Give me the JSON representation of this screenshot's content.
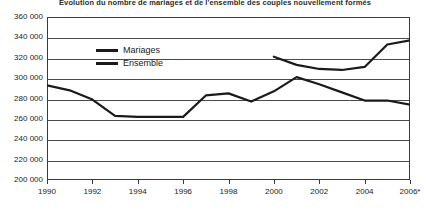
{
  "chart_data": {
    "type": "line",
    "title": "Évolution du nombre de mariages et de l'ensemble des couples nouvellement formés",
    "xlabel": "",
    "ylabel": "",
    "x": [
      1990,
      1991,
      1992,
      1993,
      1994,
      1995,
      1996,
      1997,
      1998,
      1999,
      2000,
      2001,
      2002,
      2003,
      2004,
      2005,
      2006
    ],
    "tick_labels": [
      "1990",
      "1992",
      "1994",
      "1996",
      "1998",
      "2000",
      "2002",
      "2004",
      "2006*"
    ],
    "tick_values": [
      1990,
      1992,
      1994,
      1996,
      1998,
      2000,
      2002,
      2004,
      2006
    ],
    "ylim": [
      200000,
      360000
    ],
    "y_ticks": [
      200000,
      220000,
      240000,
      260000,
      280000,
      300000,
      320000,
      340000,
      360000
    ],
    "y_tick_labels": [
      "200 000",
      "220 000",
      "240 000",
      "260 000",
      "280 000",
      "300 000",
      "320 000",
      "340 000",
      "360 000"
    ],
    "grid": true,
    "legend_position": "inside-top-left",
    "series": [
      {
        "name": "Mariages",
        "color": "#1a1a1a",
        "x": [
          1990,
          1991,
          1992,
          1993,
          1994,
          1995,
          1996,
          1997,
          1998,
          1999,
          2000,
          2001,
          2002,
          2003,
          2004,
          2005,
          2006
        ],
        "values": [
          293000,
          288000,
          279000,
          263000,
          262000,
          262000,
          262000,
          283000,
          285000,
          277000,
          287000,
          301000,
          294000,
          286000,
          278000,
          278000,
          274000
        ]
      },
      {
        "name": "Ensemble",
        "color": "#1a1a1a",
        "x": [
          2000,
          2001,
          2002,
          2003,
          2004,
          2005,
          2006
        ],
        "values": [
          321000,
          313000,
          309000,
          308000,
          311000,
          333000,
          337000
        ]
      }
    ]
  },
  "legend": {
    "entries": [
      {
        "label": "Mariages"
      },
      {
        "label": "Ensemble"
      }
    ]
  },
  "colors": {
    "line": "#1a1a1a",
    "grid": "#4a4a4a",
    "axis": "#3a3a3a",
    "background": "#ffffff"
  }
}
